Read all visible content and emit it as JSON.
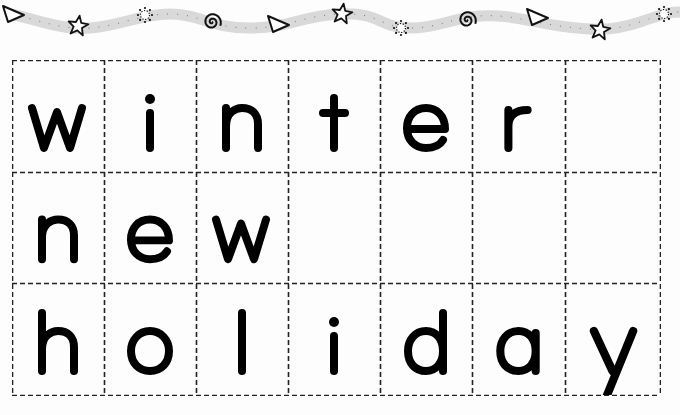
{
  "worksheet": {
    "border_icons": [
      {
        "type": "triangle-icon",
        "x": 14,
        "y": 15
      },
      {
        "type": "star-icon",
        "x": 78,
        "y": 26
      },
      {
        "type": "sun-icon",
        "x": 145,
        "y": 15
      },
      {
        "type": "spiral-icon",
        "x": 212,
        "y": 22
      },
      {
        "type": "triangle-icon",
        "x": 279,
        "y": 25
      },
      {
        "type": "star-icon",
        "x": 342,
        "y": 14
      },
      {
        "type": "sun-icon",
        "x": 401,
        "y": 28
      },
      {
        "type": "spiral-icon",
        "x": 467,
        "y": 20
      },
      {
        "type": "triangle-icon",
        "x": 538,
        "y": 18
      },
      {
        "type": "star-icon",
        "x": 600,
        "y": 30
      },
      {
        "type": "sun-icon",
        "x": 664,
        "y": 14
      }
    ],
    "grid": {
      "columns": 7,
      "rows": [
        {
          "word": "winter",
          "letters": [
            "w",
            "i",
            "n",
            "t",
            "e",
            "r",
            ""
          ]
        },
        {
          "word": "new",
          "letters": [
            "n",
            "e",
            "w",
            "",
            "",
            "",
            ""
          ]
        },
        {
          "word": "holiday",
          "letters": [
            "h",
            "o",
            "l",
            "i",
            "d",
            "a",
            "y"
          ]
        }
      ]
    },
    "colors": {
      "ink": "#000000",
      "dashed_line": "#222222",
      "ribbon": "#d9d9d9",
      "background": "#fdfdfd"
    }
  }
}
